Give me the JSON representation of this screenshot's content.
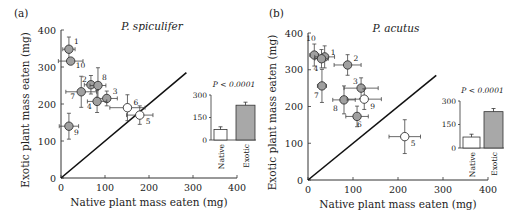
{
  "chart_data": [
    {
      "type": "scatter",
      "panel": "(a)",
      "title": "P. spiculifer",
      "xlabel": "Native plant mass eaten (mg)",
      "ylabel": "Exotic plant mass eaten (mg)",
      "xlim": [
        0,
        400
      ],
      "ylim": [
        0,
        400
      ],
      "xticks": [
        "0",
        "100",
        "200",
        "300",
        "400"
      ],
      "yticks": [
        "0",
        "100",
        "200",
        "300",
        "400"
      ],
      "reference_line": "y = x",
      "points": [
        {
          "id": "1",
          "x": 18,
          "y": 348,
          "xerr": 14,
          "yerr": 33,
          "fill": "gray"
        },
        {
          "id": "10",
          "x": 22,
          "y": 316,
          "xerr": 28,
          "yerr": 0,
          "fill": "gray"
        },
        {
          "id": "2",
          "x": 68,
          "y": 252,
          "xerr": 15,
          "yerr": 25,
          "fill": "gray"
        },
        {
          "id": "8",
          "x": 84,
          "y": 250,
          "xerr": 18,
          "yerr": 48,
          "fill": "gray"
        },
        {
          "id": "7",
          "x": 46,
          "y": 233,
          "xerr": 35,
          "yerr": 42,
          "fill": "gray"
        },
        {
          "id": "3",
          "x": 104,
          "y": 215,
          "xerr": 24,
          "yerr": 20,
          "fill": "gray"
        },
        {
          "id": "4",
          "x": 82,
          "y": 207,
          "xerr": 22,
          "yerr": 30,
          "fill": "gray"
        },
        {
          "id": "6",
          "x": 151,
          "y": 190,
          "xerr": 40,
          "yerr": 35,
          "fill": "white"
        },
        {
          "id": "5",
          "x": 179,
          "y": 170,
          "xerr": 30,
          "yerr": 25,
          "fill": "white"
        },
        {
          "id": "9",
          "x": 18,
          "y": 140,
          "xerr": 22,
          "yerr": 35,
          "fill": "gray"
        }
      ],
      "inset": {
        "type": "bar",
        "p_value": "P < 0.0001",
        "yticks": [
          "0",
          "150",
          "300"
        ],
        "ylim": [
          0,
          300
        ],
        "categories": [
          "Native",
          "Exotic"
        ],
        "values": [
          70,
          232
        ],
        "errors": [
          18,
          20
        ],
        "colors": [
          "#ffffff",
          "#a8a8a8"
        ]
      }
    },
    {
      "type": "scatter",
      "panel": "(b)",
      "title": "P. acutus",
      "xlabel": "Native plant mass eaten (mg)",
      "ylabel": "Exotic plant mass eaten (mg)",
      "xlim": [
        0,
        400
      ],
      "ylim": [
        0,
        400
      ],
      "xticks": [
        "0",
        "100",
        "200",
        "300",
        "400"
      ],
      "yticks": [
        "0",
        "100",
        "200",
        "300",
        "400"
      ],
      "reference_line": "y = x",
      "points": [
        {
          "id": "10",
          "x": 14,
          "y": 340,
          "xerr": 10,
          "yerr": 30,
          "fill": "gray"
        },
        {
          "id": "1",
          "x": 37,
          "y": 335,
          "xerr": 22,
          "yerr": 30,
          "fill": "gray"
        },
        {
          "id": "4",
          "x": 30,
          "y": 330,
          "xerr": 15,
          "yerr": 25,
          "fill": "gray"
        },
        {
          "id": "2",
          "x": 88,
          "y": 313,
          "xerr": 30,
          "yerr": 28,
          "fill": "gray"
        },
        {
          "id": "7",
          "x": 31,
          "y": 256,
          "xerr": 10,
          "yerr": 45,
          "fill": "gray"
        },
        {
          "id": "3",
          "x": 118,
          "y": 250,
          "xerr": 38,
          "yerr": 28,
          "fill": "gray"
        },
        {
          "id": "8",
          "x": 80,
          "y": 218,
          "xerr": 25,
          "yerr": 38,
          "fill": "gray"
        },
        {
          "id": "9",
          "x": 125,
          "y": 220,
          "xerr": 38,
          "yerr": 28,
          "fill": "white"
        },
        {
          "id": "6",
          "x": 109,
          "y": 173,
          "xerr": 25,
          "yerr": 28,
          "fill": "gray"
        },
        {
          "id": "5",
          "x": 215,
          "y": 118,
          "xerr": 35,
          "yerr": 46,
          "fill": "white"
        }
      ],
      "inset": {
        "type": "bar",
        "p_value": "P < 0.0001",
        "yticks": [
          "0",
          "150",
          "300"
        ],
        "ylim": [
          0,
          300
        ],
        "categories": [
          "Native",
          "Exotic"
        ],
        "values": [
          70,
          232
        ],
        "errors": [
          18,
          20
        ],
        "colors": [
          "#ffffff",
          "#a8a8a8"
        ]
      }
    }
  ]
}
